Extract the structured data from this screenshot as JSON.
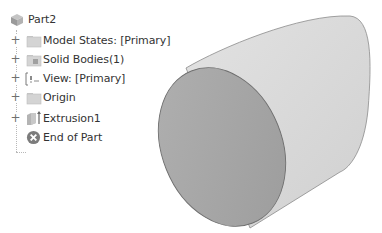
{
  "browser": {
    "root": {
      "label": "Part2",
      "icon": "part-icon"
    },
    "items": [
      {
        "label": "Model States: [Primary]",
        "icon": "folder-icon",
        "expandable": true,
        "expander": "+"
      },
      {
        "label": "Solid Bodies(1)",
        "icon": "solid-bodies-icon",
        "expandable": true,
        "expander": "+"
      },
      {
        "label": "View: [Primary]",
        "icon": "view-icon",
        "expandable": true,
        "expander": "+"
      },
      {
        "label": "Origin",
        "icon": "folder-icon",
        "expandable": true,
        "expander": "+"
      },
      {
        "label": "Extrusion1",
        "icon": "extrusion-icon",
        "expandable": true,
        "expander": "+"
      },
      {
        "label": "End of Part",
        "icon": "end-of-part-icon",
        "expandable": false
      }
    ]
  },
  "viewport": {
    "model": "cylinder",
    "colors": {
      "body": "#dcdcdc",
      "front_face": "#a8a8a8",
      "edge": "#6e6e6e"
    }
  }
}
